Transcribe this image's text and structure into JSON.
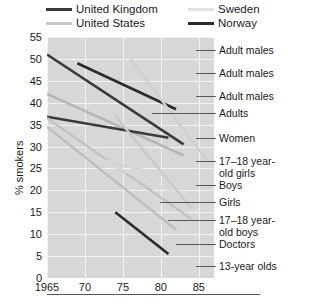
{
  "chart_data": {
    "type": "line",
    "title": "",
    "xlabel": "",
    "ylabel": "% smokers",
    "xlim": [
      1965,
      1987
    ],
    "ylim": [
      0,
      55
    ],
    "xticks": [
      "1965",
      "70",
      "75",
      "80",
      "85"
    ],
    "xtick_values": [
      1965,
      1970,
      1975,
      1980,
      1985
    ],
    "yticks": [
      "0",
      "5",
      "10",
      "15",
      "20",
      "25",
      "30",
      "35",
      "40",
      "45",
      "50",
      "55"
    ],
    "ytick_values": [
      0,
      5,
      10,
      15,
      20,
      25,
      30,
      35,
      40,
      45,
      50,
      55
    ],
    "grid": true,
    "legend_position": "top",
    "legend": [
      {
        "name": "United Kingdom",
        "color": "#3a3a3a"
      },
      {
        "name": "United States",
        "color": "#c9c9c9"
      },
      {
        "name": "Sweden",
        "color": "#e3e3e3"
      },
      {
        "name": "Norway",
        "color": "#2b2b2b"
      }
    ],
    "series": [
      {
        "name": "United Kingdom adult males",
        "country": "United Kingdom",
        "label": "Adult males",
        "color": "#3a3a3a",
        "width": 2.6,
        "points": [
          [
            1965,
            51.0
          ],
          [
            1983,
            30.5
          ]
        ]
      },
      {
        "name": "Norway adult males",
        "country": "Norway",
        "label": "Adult males",
        "color": "#2b2b2b",
        "width": 2.6,
        "points": [
          [
            1969,
            49.0
          ],
          [
            1982,
            38.5
          ]
        ]
      },
      {
        "name": "United States adult males",
        "country": "United States",
        "label": "Adult males",
        "color": "#b5b5b5",
        "width": 2.4,
        "points": [
          [
            1965,
            42.0
          ],
          [
            1983,
            28.0
          ]
        ]
      },
      {
        "name": "United Kingdom adults",
        "country": "United Kingdom",
        "label": "Adults",
        "color": "#3a3a3a",
        "width": 2.4,
        "points": [
          [
            1965,
            36.8
          ],
          [
            1981,
            32.0
          ]
        ]
      },
      {
        "name": "Sweden women",
        "country": "Sweden",
        "label": "Women",
        "color": "#cfcfcf",
        "width": 2.4,
        "points": [
          [
            1976,
            50.0
          ],
          [
            1986,
            27.0
          ]
        ]
      },
      {
        "name": "United States 17-18 year-old girls",
        "country": "United States",
        "label": "17–18 year-old girls",
        "color": "#c2c2c2",
        "width": 2.4,
        "points": [
          [
            1965,
            36.5
          ],
          [
            1984,
            13.5
          ]
        ]
      },
      {
        "name": "Sweden boys",
        "country": "Sweden",
        "label": "Boys",
        "color": "#d5d5d5",
        "width": 2.4,
        "points": [
          [
            1971,
            27.5
          ],
          [
            1985,
            21.5
          ]
        ]
      },
      {
        "name": "Sweden girls",
        "country": "Sweden",
        "label": "Girls",
        "color": "#d9d9d9",
        "width": 2.4,
        "points": [
          [
            1968,
            30.0
          ],
          [
            1983,
            18.5
          ]
        ]
      },
      {
        "name": "United States 17-18 year-old boys",
        "country": "United States",
        "label": "17–18 year-old boys",
        "color": "#c9c9c9",
        "width": 2.4,
        "points": [
          [
            1974,
            37.0
          ],
          [
            1984,
            16.0
          ]
        ]
      },
      {
        "name": "United Kingdom doctors",
        "country": "United Kingdom",
        "label": "Doctors",
        "color": "#bdbdbd",
        "width": 2.4,
        "points": [
          [
            1965,
            34.5
          ],
          [
            1982,
            11.0
          ]
        ]
      },
      {
        "name": "Norway 13-year olds",
        "country": "Norway",
        "label": "13-year olds",
        "color": "#2b2b2b",
        "width": 2.6,
        "points": [
          [
            1974,
            15.0
          ],
          [
            1981,
            5.5
          ]
        ]
      }
    ],
    "annotations": [
      {
        "label": "Adult males",
        "y_value": 48.0,
        "connects_to": "Norway adult males"
      },
      {
        "label": "Adult males",
        "y_value": 41.5,
        "connects_to": "United Kingdom adult males"
      },
      {
        "label": "Adult males",
        "y_value": 36.0,
        "connects_to": "United States adult males"
      },
      {
        "label": "Adults",
        "y_value": 32.5,
        "connects_to": "United Kingdom adults"
      },
      {
        "label": "Women",
        "y_value": 27.0,
        "connects_to": "Sweden women"
      },
      {
        "label": "17–18 year-\nold girls",
        "y_value": 22.0,
        "connects_to": "United States 17-18 year-old girls"
      },
      {
        "label": "Boys",
        "y_value": 19.5,
        "connects_to": "Sweden boys"
      },
      {
        "label": "Girls",
        "y_value": 17.0,
        "connects_to": "Sweden girls"
      },
      {
        "label": "17–18 year-\nold boys",
        "y_value": 13.0,
        "connects_to": "United States 17-18 year-old boys"
      },
      {
        "label": "Doctors",
        "y_value": 9.5,
        "connects_to": "United Kingdom doctors"
      },
      {
        "label": "13-year olds",
        "y_value": 5.5,
        "connects_to": "Norway 13-year olds"
      }
    ],
    "style": {
      "plot_background": "#d7d7d7",
      "grid_color": "#f2f2f2",
      "text_color": "#1a1a1a",
      "page_background": "#ffffff"
    }
  }
}
